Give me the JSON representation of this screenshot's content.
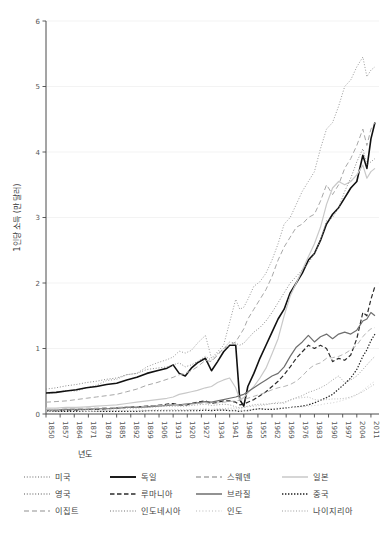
{
  "chart_data": {
    "type": "line",
    "title": "",
    "xlabel": "년도",
    "ylabel": "1인당 소득 (만 달러)",
    "xlim": [
      1850,
      2015
    ],
    "ylim": [
      0,
      6
    ],
    "yticks": [
      "0",
      "1",
      "2",
      "3",
      "4",
      "5",
      "6"
    ],
    "xticks": [
      "1850",
      "1857",
      "1864",
      "1871",
      "1878",
      "1885",
      "1892",
      "1899",
      "1906",
      "1913",
      "1920",
      "1927",
      "1934",
      "1941",
      "1948",
      "1955",
      "1962",
      "1969",
      "1976",
      "1983",
      "1990",
      "1997",
      "2004",
      "2011"
    ],
    "grid": true,
    "legend_position": "bottom",
    "legend_columns": 4,
    "x": [
      1850,
      1855,
      1860,
      1865,
      1870,
      1875,
      1880,
      1885,
      1890,
      1895,
      1900,
      1905,
      1910,
      1913,
      1916,
      1919,
      1922,
      1925,
      1929,
      1932,
      1935,
      1938,
      1941,
      1944,
      1946,
      1948,
      1950,
      1953,
      1956,
      1959,
      1962,
      1965,
      1968,
      1971,
      1974,
      1977,
      1980,
      1983,
      1986,
      1989,
      1992,
      1995,
      1998,
      2001,
      2004,
      2007,
      2009,
      2011,
      2013
    ],
    "series": [
      {
        "name": "미국",
        "style": "dotted",
        "color": "#9a9a9a",
        "width": 1.0,
        "values": [
          0.31,
          0.33,
          0.36,
          0.35,
          0.4,
          0.44,
          0.51,
          0.53,
          0.6,
          0.62,
          0.72,
          0.78,
          0.83,
          0.87,
          0.96,
          0.93,
          0.97,
          1.08,
          1.2,
          0.85,
          0.95,
          1.05,
          1.4,
          1.75,
          1.6,
          1.63,
          1.75,
          1.95,
          2.02,
          2.15,
          2.35,
          2.6,
          2.9,
          3.0,
          3.2,
          3.4,
          3.55,
          3.7,
          4.05,
          4.35,
          4.45,
          4.7,
          5.0,
          5.1,
          5.3,
          5.45,
          5.15,
          5.25,
          5.3
        ]
      },
      {
        "name": "독일",
        "style": "solid",
        "color": "#111111",
        "width": 1.6,
        "values": [
          0.32,
          0.33,
          0.35,
          0.37,
          0.4,
          0.42,
          0.45,
          0.47,
          0.52,
          0.56,
          0.62,
          0.66,
          0.7,
          0.75,
          0.62,
          0.58,
          0.7,
          0.78,
          0.85,
          0.66,
          0.8,
          0.95,
          1.05,
          1.05,
          0.22,
          0.12,
          0.42,
          0.62,
          0.85,
          1.05,
          1.25,
          1.45,
          1.6,
          1.85,
          2.0,
          2.15,
          2.35,
          2.45,
          2.65,
          2.9,
          3.05,
          3.15,
          3.3,
          3.45,
          3.55,
          3.95,
          3.75,
          4.2,
          4.45
        ]
      },
      {
        "name": "스웨덴",
        "style": "dashed",
        "color": "#a8a8a8",
        "width": 1.0,
        "values": [
          0.18,
          0.19,
          0.2,
          0.22,
          0.24,
          0.26,
          0.28,
          0.3,
          0.34,
          0.38,
          0.44,
          0.48,
          0.53,
          0.56,
          0.6,
          0.62,
          0.66,
          0.72,
          0.82,
          0.8,
          0.9,
          1.0,
          1.05,
          1.1,
          1.2,
          1.3,
          1.45,
          1.6,
          1.75,
          1.9,
          2.1,
          2.35,
          2.55,
          2.7,
          2.85,
          2.9,
          3.0,
          3.05,
          3.25,
          3.5,
          3.35,
          3.5,
          3.75,
          3.9,
          4.1,
          4.35,
          4.1,
          4.35,
          4.45
        ]
      },
      {
        "name": "일본",
        "style": "solid",
        "color": "#c9c9c9",
        "width": 1.2,
        "values": [
          0.09,
          0.09,
          0.1,
          0.1,
          0.11,
          0.12,
          0.13,
          0.14,
          0.16,
          0.18,
          0.2,
          0.22,
          0.24,
          0.26,
          0.3,
          0.32,
          0.34,
          0.36,
          0.4,
          0.42,
          0.48,
          0.52,
          0.55,
          0.4,
          0.22,
          0.25,
          0.32,
          0.42,
          0.55,
          0.7,
          0.92,
          1.15,
          1.5,
          1.8,
          2.0,
          2.2,
          2.4,
          2.6,
          2.85,
          3.2,
          3.45,
          3.55,
          3.5,
          3.55,
          3.65,
          3.8,
          3.6,
          3.7,
          3.75
        ]
      },
      {
        "name": "영국",
        "style": "dotted",
        "color": "#8c8c8c",
        "width": 1.0,
        "values": [
          0.38,
          0.4,
          0.43,
          0.45,
          0.48,
          0.5,
          0.53,
          0.55,
          0.6,
          0.62,
          0.68,
          0.7,
          0.72,
          0.75,
          0.78,
          0.72,
          0.75,
          0.8,
          0.88,
          0.82,
          0.92,
          1.0,
          1.1,
          1.08,
          1.05,
          1.08,
          1.15,
          1.25,
          1.32,
          1.42,
          1.55,
          1.7,
          1.85,
          2.0,
          2.1,
          2.2,
          2.3,
          2.45,
          2.65,
          2.95,
          3.0,
          3.15,
          3.4,
          3.6,
          3.85,
          4.05,
          3.8,
          3.85,
          3.9
        ]
      },
      {
        "name": "루마니아",
        "style": "dashed-dark",
        "color": "#2b2b2b",
        "width": 1.2,
        "values": [
          0.05,
          0.05,
          0.06,
          0.06,
          0.07,
          0.07,
          0.08,
          0.09,
          0.1,
          0.11,
          0.12,
          0.13,
          0.15,
          0.16,
          0.14,
          0.13,
          0.16,
          0.18,
          0.2,
          0.16,
          0.18,
          0.2,
          0.2,
          0.18,
          0.14,
          0.15,
          0.18,
          0.22,
          0.28,
          0.34,
          0.42,
          0.5,
          0.6,
          0.72,
          0.85,
          0.95,
          1.05,
          1.0,
          1.05,
          1.0,
          0.8,
          0.85,
          0.82,
          0.9,
          1.15,
          1.55,
          1.5,
          1.75,
          1.95
        ]
      },
      {
        "name": "브라질",
        "style": "solid",
        "color": "#6e6e6e",
        "width": 1.2,
        "values": [
          0.06,
          0.06,
          0.07,
          0.07,
          0.07,
          0.08,
          0.08,
          0.09,
          0.1,
          0.1,
          0.11,
          0.12,
          0.13,
          0.14,
          0.14,
          0.15,
          0.16,
          0.17,
          0.19,
          0.18,
          0.2,
          0.22,
          0.24,
          0.26,
          0.28,
          0.3,
          0.34,
          0.4,
          0.46,
          0.52,
          0.58,
          0.62,
          0.72,
          0.88,
          1.02,
          1.1,
          1.2,
          1.1,
          1.18,
          1.22,
          1.15,
          1.22,
          1.25,
          1.22,
          1.28,
          1.42,
          1.45,
          1.55,
          1.5
        ]
      },
      {
        "name": "중국",
        "style": "dotted-dark",
        "color": "#1f1f1f",
        "width": 1.2,
        "values": [
          0.04,
          0.04,
          0.04,
          0.04,
          0.04,
          0.04,
          0.04,
          0.04,
          0.04,
          0.04,
          0.05,
          0.05,
          0.05,
          0.05,
          0.05,
          0.05,
          0.05,
          0.05,
          0.06,
          0.05,
          0.06,
          0.06,
          0.05,
          0.05,
          0.04,
          0.05,
          0.05,
          0.07,
          0.08,
          0.07,
          0.07,
          0.08,
          0.09,
          0.1,
          0.11,
          0.12,
          0.14,
          0.17,
          0.21,
          0.25,
          0.3,
          0.38,
          0.46,
          0.55,
          0.68,
          0.88,
          0.98,
          1.12,
          1.22
        ]
      },
      {
        "name": "이집트",
        "style": "dashed",
        "color": "#b5b5b5",
        "width": 1.0,
        "values": [
          0.07,
          0.07,
          0.08,
          0.08,
          0.09,
          0.09,
          0.1,
          0.1,
          0.11,
          0.11,
          0.12,
          0.13,
          0.14,
          0.15,
          0.14,
          0.14,
          0.15,
          0.16,
          0.17,
          0.16,
          0.17,
          0.18,
          0.19,
          0.2,
          0.21,
          0.22,
          0.24,
          0.27,
          0.3,
          0.33,
          0.37,
          0.4,
          0.42,
          0.45,
          0.5,
          0.58,
          0.68,
          0.75,
          0.78,
          0.85,
          0.86,
          0.88,
          0.92,
          0.98,
          1.05,
          1.18,
          1.25,
          1.3,
          1.32
        ]
      },
      {
        "name": "인도네시아",
        "style": "dotted",
        "color": "#a0a0a0",
        "width": 1.0,
        "values": [
          0.06,
          0.06,
          0.06,
          0.07,
          0.07,
          0.07,
          0.08,
          0.08,
          0.09,
          0.09,
          0.1,
          0.11,
          0.12,
          0.12,
          0.12,
          0.12,
          0.13,
          0.14,
          0.15,
          0.13,
          0.14,
          0.15,
          0.14,
          0.11,
          0.09,
          0.1,
          0.12,
          0.14,
          0.15,
          0.15,
          0.16,
          0.16,
          0.18,
          0.21,
          0.25,
          0.28,
          0.33,
          0.36,
          0.4,
          0.45,
          0.52,
          0.58,
          0.48,
          0.52,
          0.58,
          0.68,
          0.75,
          0.82,
          0.88
        ]
      },
      {
        "name": "인도",
        "style": "dotted-light",
        "color": "#cfcfcf",
        "width": 1.0,
        "values": [
          0.05,
          0.05,
          0.05,
          0.05,
          0.05,
          0.05,
          0.06,
          0.06,
          0.06,
          0.06,
          0.06,
          0.06,
          0.06,
          0.07,
          0.07,
          0.06,
          0.07,
          0.07,
          0.07,
          0.07,
          0.07,
          0.07,
          0.07,
          0.07,
          0.06,
          0.06,
          0.07,
          0.07,
          0.08,
          0.08,
          0.08,
          0.09,
          0.09,
          0.1,
          0.1,
          0.11,
          0.12,
          0.13,
          0.14,
          0.16,
          0.17,
          0.19,
          0.22,
          0.25,
          0.29,
          0.36,
          0.41,
          0.46,
          0.5
        ]
      },
      {
        "name": "나이지리아",
        "style": "dotted",
        "color": "#bdbdbd",
        "width": 1.0,
        "values": [
          0.04,
          0.04,
          0.04,
          0.04,
          0.04,
          0.04,
          0.05,
          0.05,
          0.05,
          0.05,
          0.05,
          0.06,
          0.06,
          0.06,
          0.06,
          0.06,
          0.07,
          0.07,
          0.08,
          0.07,
          0.08,
          0.08,
          0.09,
          0.09,
          0.09,
          0.1,
          0.11,
          0.12,
          0.13,
          0.14,
          0.16,
          0.18,
          0.16,
          0.22,
          0.24,
          0.25,
          0.26,
          0.22,
          0.21,
          0.22,
          0.23,
          0.23,
          0.24,
          0.26,
          0.3,
          0.34,
          0.38,
          0.42,
          0.46
        ]
      }
    ]
  },
  "legend": {
    "items": [
      {
        "label": "미국"
      },
      {
        "label": "독일"
      },
      {
        "label": "스웨덴"
      },
      {
        "label": "일본"
      },
      {
        "label": "영국"
      },
      {
        "label": "루마니아"
      },
      {
        "label": "브라질"
      },
      {
        "label": "중국"
      },
      {
        "label": "이집트"
      },
      {
        "label": "인도네시아"
      },
      {
        "label": "인도"
      },
      {
        "label": "나이지리아"
      }
    ]
  }
}
